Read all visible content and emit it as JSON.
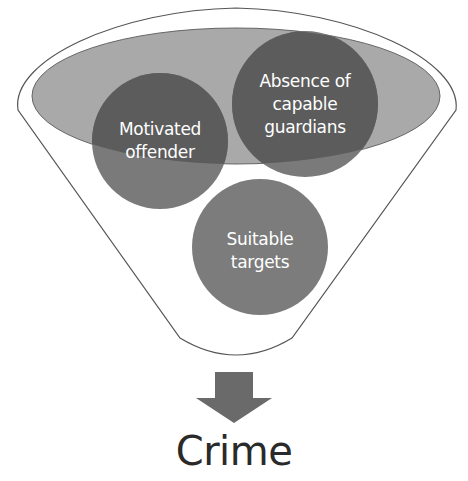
{
  "diagram": {
    "type": "funnel",
    "circles": [
      {
        "id": "motivated-offender",
        "label_lines": [
          "Motivated",
          "offender"
        ]
      },
      {
        "id": "capable-guardians",
        "label_lines": [
          "Absence of",
          "capable",
          "guardians"
        ]
      },
      {
        "id": "suitable-targets",
        "label_lines": [
          "Suitable",
          "targets"
        ]
      }
    ],
    "output_label": "Crime"
  },
  "colors": {
    "funnel_stroke": "#555555",
    "ellipse_fill": "#a9a9a9",
    "circle_fill": "#7a7a7a",
    "circle_overlap_fill": "#5c5c5c",
    "arrow_fill": "#6a6a6a",
    "crime_text": "#2a2a2a"
  }
}
